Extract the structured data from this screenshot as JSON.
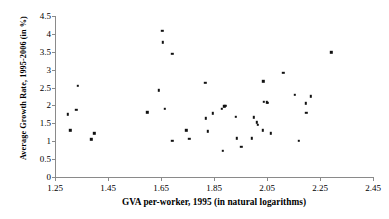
{
  "chart_data": {
    "type": "scatter",
    "title": "",
    "xlabel": "GVA per-worker, 1995 (in natural logarithms)",
    "ylabel": "Average Growth Rate, 1995-2006 (in %)",
    "xlim": [
      1.25,
      2.45
    ],
    "ylim": [
      0,
      4.5
    ],
    "xticks": [
      "1.25",
      "1.45",
      "1.65",
      "1.85",
      "2.05",
      "2.25",
      "2.45"
    ],
    "xtick_values": [
      1.25,
      1.45,
      1.65,
      1.85,
      2.05,
      2.25,
      2.45
    ],
    "yticks": [
      "0",
      "0.5",
      "1",
      "1.5",
      "2",
      "2.5",
      "3",
      "3.5",
      "4",
      "4.5"
    ],
    "ytick_values": [
      0,
      0.5,
      1,
      1.5,
      2,
      2.5,
      3,
      3.5,
      4,
      4.5
    ],
    "grid": false,
    "legend": false,
    "marker": "square",
    "marker_color": "#111111",
    "axis_color": "#8a8a8a",
    "points": [
      {
        "x": 1.299,
        "y": 1.75
      },
      {
        "x": 1.308,
        "y": 1.3
      },
      {
        "x": 1.331,
        "y": 1.88
      },
      {
        "x": 1.337,
        "y": 2.55
      },
      {
        "x": 1.387,
        "y": 1.05
      },
      {
        "x": 1.398,
        "y": 1.22
      },
      {
        "x": 1.598,
        "y": 1.81
      },
      {
        "x": 1.641,
        "y": 2.42
      },
      {
        "x": 1.655,
        "y": 4.08
      },
      {
        "x": 1.657,
        "y": 3.76
      },
      {
        "x": 1.664,
        "y": 1.91
      },
      {
        "x": 1.692,
        "y": 3.44
      },
      {
        "x": 1.693,
        "y": 1.02
      },
      {
        "x": 1.745,
        "y": 1.3
      },
      {
        "x": 1.757,
        "y": 1.06
      },
      {
        "x": 1.817,
        "y": 2.63
      },
      {
        "x": 1.82,
        "y": 1.64
      },
      {
        "x": 1.827,
        "y": 1.28
      },
      {
        "x": 1.846,
        "y": 1.78
      },
      {
        "x": 1.879,
        "y": 1.91
      },
      {
        "x": 1.889,
        "y": 1.98
      },
      {
        "x": 1.893,
        "y": 1.99
      },
      {
        "x": 1.883,
        "y": 0.74
      },
      {
        "x": 1.932,
        "y": 1.68
      },
      {
        "x": 1.936,
        "y": 1.08
      },
      {
        "x": 1.953,
        "y": 0.85
      },
      {
        "x": 1.993,
        "y": 1.08
      },
      {
        "x": 2.001,
        "y": 1.67
      },
      {
        "x": 2.012,
        "y": 1.53
      },
      {
        "x": 2.016,
        "y": 1.46
      },
      {
        "x": 2.036,
        "y": 2.68
      },
      {
        "x": 2.038,
        "y": 2.1
      },
      {
        "x": 2.049,
        "y": 2.09
      },
      {
        "x": 2.052,
        "y": 2.08
      },
      {
        "x": 2.034,
        "y": 1.3
      },
      {
        "x": 2.065,
        "y": 1.22
      },
      {
        "x": 2.112,
        "y": 2.92
      },
      {
        "x": 2.156,
        "y": 2.3
      },
      {
        "x": 2.171,
        "y": 1.02
      },
      {
        "x": 2.196,
        "y": 2.06
      },
      {
        "x": 2.198,
        "y": 1.79
      },
      {
        "x": 2.216,
        "y": 2.26
      },
      {
        "x": 2.292,
        "y": 3.49
      }
    ]
  }
}
